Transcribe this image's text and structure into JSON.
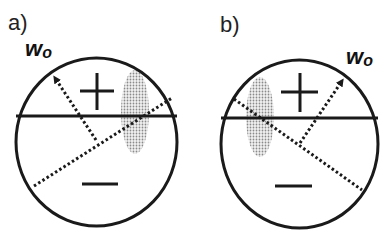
{
  "panels": [
    {
      "label": "a)",
      "weight_label": "w",
      "weight_sub": "o",
      "plus": "+",
      "minus": "−",
      "circle": {
        "cx": 96.5,
        "cy": 142,
        "rx": 80.5,
        "ry": 84
      },
      "boundary_y": 116,
      "arrow": {
        "from": [
          96,
          140
        ],
        "to": [
          54,
          76
        ]
      },
      "dotted_line": {
        "from": [
          34,
          186
        ],
        "to": [
          172,
          98
        ]
      },
      "shaded_ellipse": {
        "cx": 135,
        "cy": 112,
        "rx": 14,
        "ry": 42
      }
    },
    {
      "label": "b)",
      "weight_label": "w",
      "weight_sub": "o",
      "plus": "+",
      "minus": "−",
      "circle": {
        "cx": 299.5,
        "cy": 144,
        "rx": 78.5,
        "ry": 84
      },
      "boundary_y": 118,
      "arrow": {
        "from": [
          300,
          143
        ],
        "to": [
          343,
          79
        ]
      },
      "dotted_line": {
        "from": [
          234,
          99
        ],
        "to": [
          362,
          190
        ]
      },
      "shaded_ellipse": {
        "cx": 260,
        "cy": 117,
        "rx": 14,
        "ry": 40
      }
    }
  ],
  "colors": {
    "stroke": "#1a1a1a",
    "shade": "#bdbdbd"
  }
}
